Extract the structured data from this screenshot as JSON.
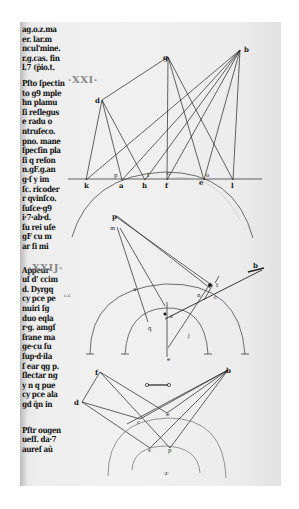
{
  "document": {
    "type": "manuscript-page-scan",
    "section_numerals": [
      {
        "text": "·XXI·",
        "x": 70,
        "y": 80
      },
      {
        "text": "·XXIJ·",
        "x": 28,
        "y": 269
      }
    ],
    "margin_note": "c.r.",
    "text_column": {
      "block1": [
        "ag.o.z.ma",
        "er. lar.m",
        "ncul'mine.",
        "r.g.cas. fin",
        "l.7 (p̄io.t."
      ],
      "block2": [
        "Pſto ſpectin",
        "to g9 mple",
        "hn plamu",
        "ſi reſlegus",
        "e radu o",
        "ntruſeco.",
        "pno. mane",
        "ſpecſin pla",
        "ſi q reſon",
        "n.gF.g.an",
        "g·ſ y im",
        "ſc. ricoder",
        "r qvinſco.",
        "ſuſce·g9",
        "i·7·ab·d.",
        "ſu rei uſe",
        "gF cu m",
        "ar ſi mi"
      ],
      "block3": [
        "Appeur",
        "uſ d' ccim",
        "d. Dyrgq",
        "cy pce pe",
        "nuiri ſg",
        "duo eqla",
        "r·g. amgſ",
        "ſrane ma",
        "ge·cu ſu",
        "ſup·d·ila",
        "ſ ear qg p.",
        "ſlectar ng",
        "y n q pue",
        "cy pce ala",
        "gd q̄n in"
      ],
      "block4": [
        "Pſtr ougen",
        "ueſſ. da·7",
        "aureſ aū"
      ]
    },
    "diagrams": [
      {
        "id": "figure-1",
        "points": {
          "g": "g",
          "b": "b",
          "d": "d",
          "k": "k",
          "a": "a",
          "h": "h",
          "f": "f",
          "e": "e",
          "l": "l",
          "p": "p",
          "t": "t",
          "c": "c",
          "o": "o"
        }
      },
      {
        "id": "figure-2",
        "points": {
          "p": "p",
          "m": "m",
          "b": "b",
          "a": "a",
          "n": "n",
          "c": "c",
          "q": "q",
          "z": "z",
          "e": "e",
          "j": "j",
          "t": "t"
        }
      },
      {
        "id": "figure-3",
        "points": {
          "f": "f",
          "b": "b",
          "d": "d",
          "c": "c",
          "e": "e",
          "s": "s",
          "p": "p",
          "z": "·z·"
        }
      }
    ]
  }
}
